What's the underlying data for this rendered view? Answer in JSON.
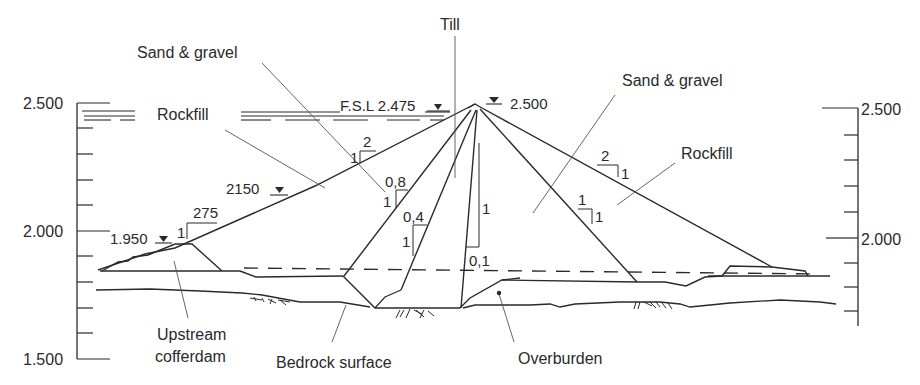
{
  "diagram": {
    "left_axis": {
      "ticks": [
        {
          "label": "2.500",
          "value": 2500
        },
        {
          "label": "2.000",
          "value": 2000
        },
        {
          "label": "1.500",
          "value": 1500
        }
      ],
      "minor_step": 100
    },
    "right_axis": {
      "ticks": [
        {
          "label": "2.500",
          "value": 2500
        },
        {
          "label": "2.000",
          "value": 2000
        }
      ],
      "minor_step": 100
    },
    "labels": {
      "till": "Till",
      "sand_gravel_left": "Sand & gravel",
      "sand_gravel_right": "Sand & gravel",
      "rockfill_left": "Rockfill",
      "rockfill_right": "Rockfill",
      "fsl": "F.S.L 2.475",
      "crest": "2.500",
      "berm": "2150",
      "cofferdam_level": "1.950",
      "upstream_cofferdam_line1": "Upstream",
      "upstream_cofferdam_line2": "cofferdam",
      "bedrock_surface": "Bedrock surface",
      "overburden": "Overburden"
    },
    "slopes": {
      "upstream_shell": {
        "run": "2",
        "rise": "1"
      },
      "upstream_lower": {
        "run": "275",
        "rise": "1"
      },
      "filter_outer": {
        "run": "0,8",
        "rise": "1"
      },
      "filter_inner": {
        "run": "0,4",
        "rise": "1"
      },
      "core_downstream": {
        "run": "0,1",
        "rise": "1"
      },
      "downstream_shell": {
        "run": "2",
        "rise": "1"
      },
      "downstream_filter": {
        "run": "1",
        "rise": "1"
      }
    },
    "colors": {
      "line": "#2a2a2a",
      "background": "#ffffff"
    }
  }
}
